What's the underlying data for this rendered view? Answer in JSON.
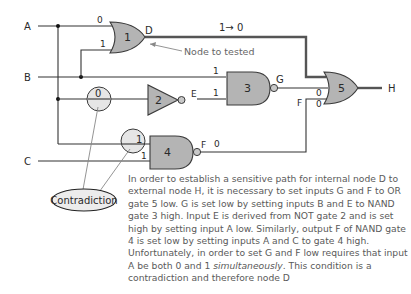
{
  "inputs": {
    "A": "A",
    "B": "B",
    "C": "C"
  },
  "output": {
    "H": "H"
  },
  "nodes": {
    "D": "D",
    "E": "E",
    "F": "F",
    "G": "G",
    "F_label5": "F"
  },
  "gates": {
    "g1": {
      "number": "1",
      "type": "OR"
    },
    "g2": {
      "number": "2",
      "type": "NOT"
    },
    "g3": {
      "number": "3",
      "type": "NAND"
    },
    "g4": {
      "number": "4",
      "type": "NAND"
    },
    "g5": {
      "number": "5",
      "type": "OR"
    }
  },
  "values": {
    "g1_in_A": "0",
    "g1_in_B": "1",
    "D_transition": "1→ 0",
    "g3_in_B": "1",
    "g3_in_E": "1",
    "g5_in_G": "0",
    "g5_in_F": "0",
    "g4_in_A": "1",
    "g4_in_C": "1",
    "F_out": "0",
    "circle_top": "0",
    "circle_bottom": "1"
  },
  "annotations": {
    "node_to_test": "Node to tested",
    "contradiction": "Contradiction"
  },
  "paragraph": {
    "part1": "In order to establish a sensitive path for internal node D to external node H, it is necessary to set inputs G and F to OR gate 5 low. G is set low by setting inputs B and E to NAND gate 3 high. Input E is derived from NOT gate 2 and is set high by setting input A low. Similarly, output F of NAND gate 4 is set low by setting inputs A and C to gate 4 high. Unfortunately, in order to set G and F low requires that input A be both 0 and 1 ",
    "emph": "simultaneously",
    "part2": ". This condition is a contradiction and therefore node D"
  },
  "colors": {
    "gate_fill": "#b4b4b4",
    "wire": "#333333",
    "text": "#5a5a5a"
  }
}
